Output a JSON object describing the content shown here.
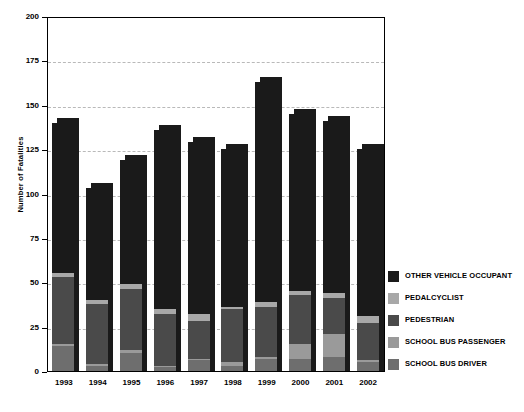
{
  "chart_data": {
    "type": "bar",
    "subtype": "stacked-bar",
    "title": "",
    "xlabel": "",
    "ylabel": "Number of Fatalities",
    "ylim": [
      0,
      200
    ],
    "ytick_values": [
      0,
      25,
      50,
      75,
      100,
      125,
      150,
      175,
      200
    ],
    "ytick_labels": [
      "0",
      "25",
      "50",
      "75",
      "100",
      "125",
      "150",
      "175",
      "200"
    ],
    "grid": true,
    "grid_axis": "y",
    "legend_position": "right",
    "categories": [
      "1993",
      "1994",
      "1995",
      "1996",
      "1997",
      "1998",
      "1999",
      "2000",
      "2001",
      "2002"
    ],
    "series": [
      {
        "name": "SCHOOL BUS DRIVER",
        "color": "#6e6e6e",
        "values": [
          14,
          3,
          10,
          2,
          6,
          3,
          7,
          7,
          8,
          5
        ]
      },
      {
        "name": "SCHOOL BUS PASSENGER",
        "color": "#9a9a9a",
        "values": [
          1,
          1,
          2,
          1,
          1,
          2,
          1,
          8,
          13,
          1
        ]
      },
      {
        "name": "PEDESTRIAN",
        "color": "#4a4a4a",
        "values": [
          38,
          34,
          34,
          29,
          21,
          30,
          28,
          28,
          20,
          21
        ]
      },
      {
        "name": "PEDALCYCLIST",
        "color": "#a8a8a8",
        "values": [
          2,
          2,
          3,
          3,
          4,
          1,
          3,
          2,
          3,
          4
        ]
      },
      {
        "name": "OTHER VEHICLE OCCUPANT",
        "color": "#1a1a1a",
        "values": [
          85,
          63,
          70,
          101,
          97,
          89,
          124,
          100,
          97,
          94
        ]
      }
    ],
    "totals": [
      140,
      103,
      119,
      136,
      129,
      125,
      163,
      145,
      141,
      125
    ]
  },
  "legend": {
    "items": [
      {
        "label": "OTHER VEHICLE OCCUPANT",
        "color": "#1a1a1a"
      },
      {
        "label": "PEDALCYCLIST",
        "color": "#a8a8a8"
      },
      {
        "label": "PEDESTRIAN",
        "color": "#4a4a4a"
      },
      {
        "label": "SCHOOL BUS PASSENGER",
        "color": "#9a9a9a"
      },
      {
        "label": "SCHOOL BUS DRIVER",
        "color": "#6e6e6e"
      }
    ]
  },
  "style": {
    "plot_background": "#ffffff",
    "axis_color": "#000000",
    "gridline_color": "#b9b9b9",
    "shadow_color": "#1a1a1a"
  }
}
